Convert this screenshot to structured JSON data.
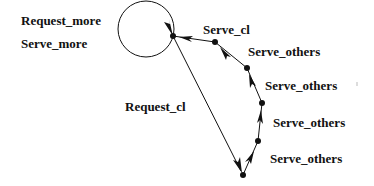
{
  "diagram": {
    "labels": {
      "request_more": "Request_more",
      "serve_more": "Serve_more",
      "serve_cl": "Serve_cl",
      "serve_others_1": "Serve_others",
      "serve_others_2": "Serve_others",
      "serve_others_3": "Serve_others",
      "serve_others_4": "Serve_others",
      "request_cl": "Request_cl"
    },
    "nodes": [
      {
        "id": "n0",
        "x": 173,
        "y": 36
      },
      {
        "id": "n1",
        "x": 215,
        "y": 42
      },
      {
        "id": "n2",
        "x": 247,
        "y": 68
      },
      {
        "id": "n3",
        "x": 262,
        "y": 103
      },
      {
        "id": "n4",
        "x": 258,
        "y": 141
      },
      {
        "id": "n5",
        "x": 243,
        "y": 175
      }
    ],
    "edges": [
      {
        "from": "n0",
        "to": "n0",
        "label": "Request_more / Serve_more",
        "type": "self-loop"
      },
      {
        "from": "n0",
        "to": "n5",
        "label": "Request_cl"
      },
      {
        "from": "n5",
        "to": "n4",
        "label": "Serve_others"
      },
      {
        "from": "n4",
        "to": "n3",
        "label": "Serve_others"
      },
      {
        "from": "n3",
        "to": "n2",
        "label": "Serve_others"
      },
      {
        "from": "n2",
        "to": "n1",
        "label": "Serve_others"
      },
      {
        "from": "n1",
        "to": "n0",
        "label": "Serve_cl"
      }
    ],
    "colors": {
      "stroke": "#111111",
      "background": "#ffffff"
    }
  }
}
